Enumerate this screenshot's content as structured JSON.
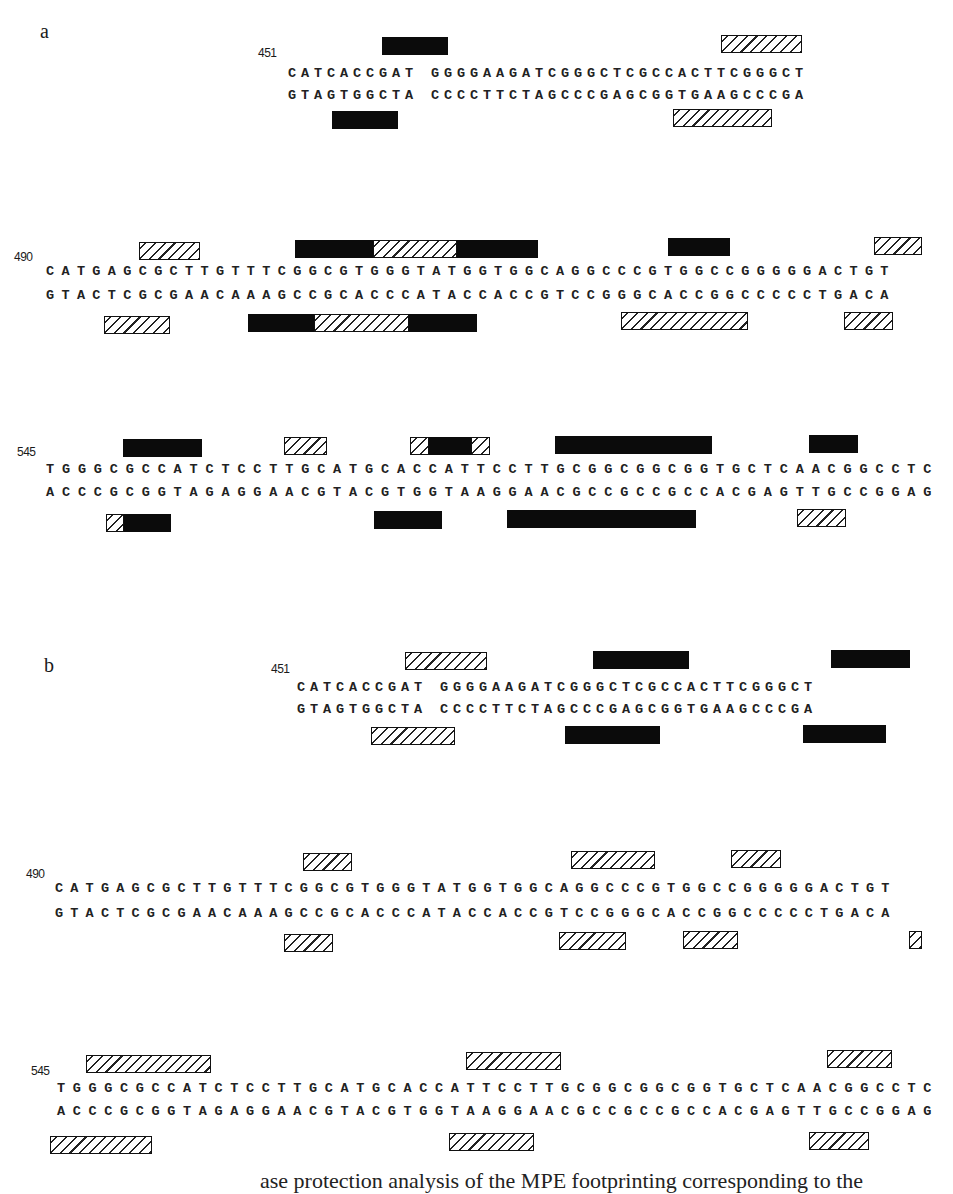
{
  "panels": [
    {
      "label": "a",
      "blocks": [
        {
          "position": "451",
          "top_strand": "CATCACCGAT GGGGAAGATCGGGCTCGCCACTTCGGGCT",
          "bottom_strand": "GTAGTGGCTA CCCCTTCTAGCCCGAGCGGTGAAGCCCGA"
        },
        {
          "position": "490",
          "top_strand": "CATGAGCGCTTGTTTCGGCGTGGGTATGGTGGCAGGCCCGTGGCCGGGGGACTGT",
          "bottom_strand": "GTACTCGCGAACAAAGCCGCACCCATACCACCGTCCGGGCACCGGCCCCCTGACA"
        },
        {
          "position": "545",
          "top_strand": "TGGGCGCCATCTCCTTGCATGCACCATTCCTTGCGGCGGCGGTGCTCAACGGCCTC",
          "bottom_strand": "ACCCGCGGTAGAGGAACGTACGTGGTAAGGAACGCCGCCGCCACGAGTTGCCGGAG"
        }
      ]
    },
    {
      "label": "b",
      "blocks": [
        {
          "position": "451",
          "top_strand": "CATCACCGAT GGGGAAGATCGGGCTCGCCACTTCGGGCT",
          "bottom_strand": "GTAGTGGCTA CCCCTTCTAGCCCGAGCGGTGAAGCCCGA"
        },
        {
          "position": "490",
          "top_strand": "CATGAGCGCTTGTTTCGGCGTGGGTATGGTGGCAGGCCCGTGGCCGGGGGACTGT",
          "bottom_strand": "GTACTCGCGAACAAAGCCGCACCCATACCACCGTCCGGGCACCGGCCCCCTGACA"
        },
        {
          "position": "545",
          "top_strand": "TGGGCGCCATCTCCTTGCATGCACCATTCCTTGCGGCGGCGGTGCTCAACGGCCTC",
          "bottom_strand": "ACCCGCGGTAGAGGAACGTACGTGGTAAGGAACGCCGCCGCCACGAGTTGCCGGAG"
        }
      ]
    }
  ],
  "legend_semantics": {
    "solid": "filled black bar",
    "hatch": "diagonally hatched bar"
  },
  "caption": "ase protection analysis of the MPE footprinting corresponding to the"
}
